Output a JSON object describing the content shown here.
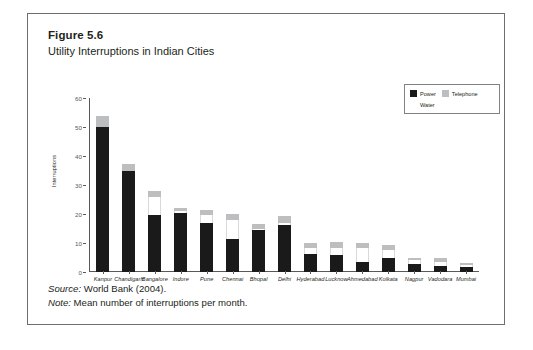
{
  "figure": {
    "number": "Figure 5.6",
    "title": "Utility Interruptions in Indian Cities"
  },
  "footer": {
    "source_key": "Source:",
    "source_text": " World Bank (2004).",
    "note_key": "Note:",
    "note_text": " Mean number of interruptions per month."
  },
  "legend": {
    "power": "Power",
    "telephone": "Telephone",
    "water": "Water"
  },
  "colors": {
    "power": "#1a1a1a",
    "telephone": "#bcbec0",
    "water": "#ffffff",
    "axis": "#58595b",
    "frame": "#6d6e70",
    "text": "#231f20"
  },
  "chart_data": {
    "type": "bar",
    "subtype": "stacked",
    "title": "Utility Interruptions in Indian Cities",
    "xlabel": "",
    "ylabel": "Interruptions",
    "ylim": [
      0,
      60
    ],
    "yticks": [
      0,
      10,
      20,
      30,
      40,
      50,
      60
    ],
    "grid": false,
    "legend_position": "top-right",
    "categories": [
      "Kanpur",
      "Chandigarh",
      "Bangalore",
      "Indore",
      "Pune",
      "Chennai",
      "Bhopal",
      "Delhi",
      "Hyderabad",
      "Lucknow",
      "Ahmedabad",
      "Kolkata",
      "Nagpur",
      "Vadodara",
      "Mumbai"
    ],
    "series": [
      {
        "name": "Power",
        "color": "#1a1a1a",
        "values": [
          50.0,
          35.0,
          19.8,
          20.3,
          17.0,
          11.5,
          14.5,
          16.3,
          6.2,
          5.8,
          3.5,
          5.0,
          2.8,
          2.2,
          1.6
        ]
      },
      {
        "name": "Water",
        "color": "#ffffff",
        "values": [
          0.0,
          0.0,
          6.2,
          0.7,
          2.5,
          6.5,
          0.4,
          0.6,
          2.1,
          2.6,
          4.8,
          2.6,
          1.2,
          1.4,
          0.7
        ]
      },
      {
        "name": "Telephone",
        "color": "#bcbec0",
        "values": [
          3.8,
          2.3,
          2.0,
          1.0,
          2.0,
          2.0,
          1.6,
          2.4,
          1.8,
          1.8,
          1.7,
          1.8,
          1.0,
          1.2,
          0.9
        ]
      }
    ],
    "totals": [
      53.8,
      37.3,
      28.0,
      22.0,
      21.5,
      20.0,
      16.5,
      19.3,
      10.1,
      10.2,
      10.0,
      9.4,
      5.0,
      4.8,
      3.2
    ]
  }
}
